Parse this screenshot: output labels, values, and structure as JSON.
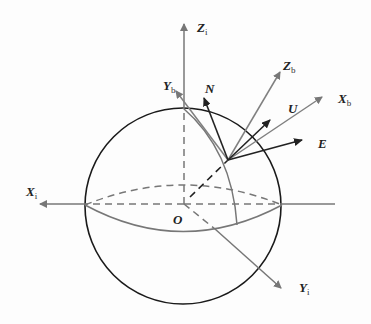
{
  "diagram": {
    "type": "coordinate-frames-on-sphere",
    "colors": {
      "sphere": "#1a1a1a",
      "axis_gray": "#777777",
      "body_gray": "#808080",
      "enu_dark": "#222222"
    },
    "origin_label": "O",
    "inertial_axes": [
      {
        "id": "Xi",
        "main": "X",
        "sub": "i"
      },
      {
        "id": "Yi",
        "main": "Y",
        "sub": "i"
      },
      {
        "id": "Zi",
        "main": "Z",
        "sub": "i"
      }
    ],
    "body_axes": [
      {
        "id": "Xb",
        "main": "X",
        "sub": "b"
      },
      {
        "id": "Yb",
        "main": "Y",
        "sub": "b"
      },
      {
        "id": "Zb",
        "main": "Z",
        "sub": "b"
      }
    ],
    "local_axes": [
      {
        "id": "E",
        "main": "E"
      },
      {
        "id": "N",
        "main": "N"
      },
      {
        "id": "U",
        "main": "U"
      }
    ]
  }
}
